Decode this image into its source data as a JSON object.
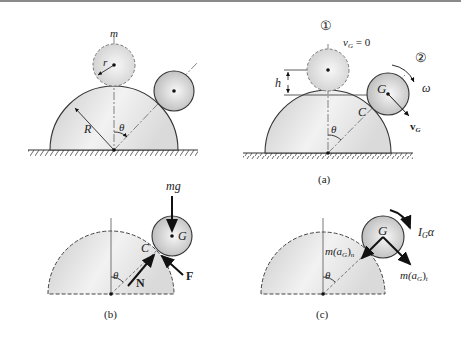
{
  "figure": {
    "panels": [
      {
        "id": "top-left",
        "labels": {
          "mass": "m",
          "small_radius": "r",
          "big_radius": "R",
          "angle": "θ"
        }
      },
      {
        "id": "a",
        "caption": "(a)",
        "labels": {
          "position1": "①",
          "position2": "②",
          "velocity_zero": "v",
          "velocity_zero_sub": "G",
          "velocity_zero_eq": " = 0",
          "height": "h",
          "center": "G",
          "contact": "C",
          "omega": "ω",
          "velocity": "v",
          "velocity_sub": "G",
          "angle": "θ"
        }
      },
      {
        "id": "b",
        "caption": "(b)",
        "labels": {
          "weight": "mg",
          "center": "G",
          "contact": "C",
          "normal": "N",
          "friction": "F",
          "angle": "θ"
        }
      },
      {
        "id": "c",
        "caption": "(c)",
        "labels": {
          "center": "G",
          "moment": "I",
          "moment_sub": "G",
          "moment_alpha": "α",
          "normal_inertia": "m(a",
          "normal_inertia_sub1": "G",
          "normal_inertia_close": ")",
          "normal_inertia_sub2": "n",
          "tangent_inertia": "m(a",
          "tangent_inertia_sub1": "G",
          "tangent_inertia_close": ")",
          "tangent_inertia_sub2": "t",
          "angle": "θ"
        }
      }
    ],
    "colors": {
      "line": "#333333",
      "fill_light": "#f4f4f4",
      "fill_dark": "#cfcfcf",
      "dashed": "#555555"
    }
  }
}
